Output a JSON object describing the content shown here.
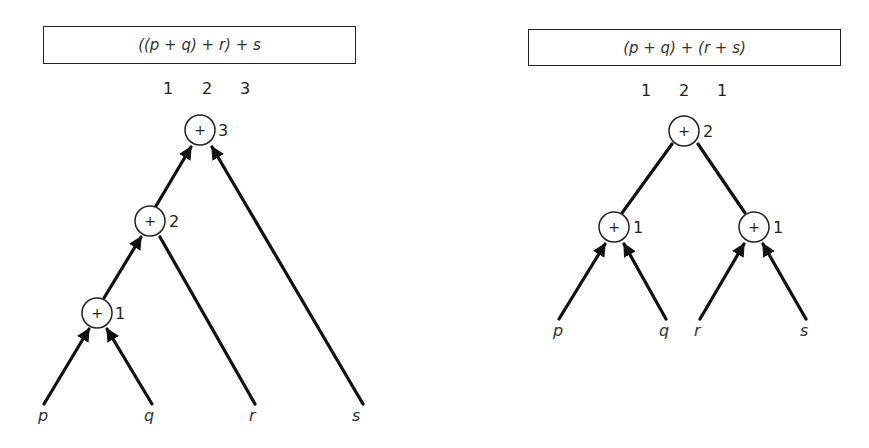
{
  "diagrams": [
    {
      "name": "left-associative",
      "expression": "((p + q) + r) + s",
      "depth_labels": [
        "1",
        "2",
        "3"
      ],
      "nodes": [
        {
          "op": "+",
          "level": "1"
        },
        {
          "op": "+",
          "level": "2"
        },
        {
          "op": "+",
          "level": "3"
        }
      ],
      "leaves": [
        "p",
        "q",
        "r",
        "s"
      ]
    },
    {
      "name": "balanced",
      "expression": "(p + q) + (r + s)",
      "depth_labels": [
        "1",
        "2",
        "1"
      ],
      "nodes": [
        {
          "op": "+",
          "level": "1"
        },
        {
          "op": "+",
          "level": "1"
        },
        {
          "op": "+",
          "level": "2"
        }
      ],
      "leaves": [
        "p",
        "q",
        "r",
        "s"
      ]
    }
  ]
}
